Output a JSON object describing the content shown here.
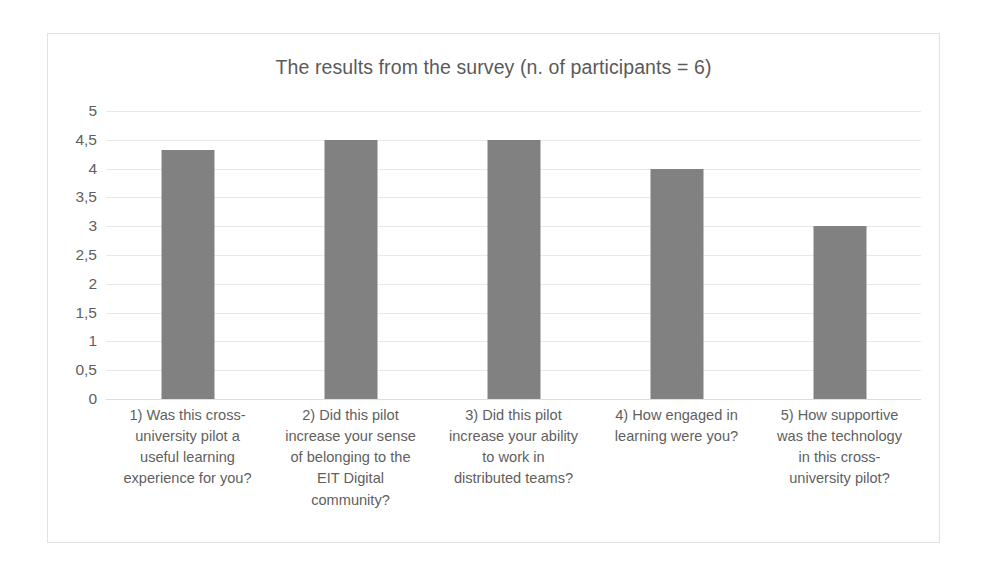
{
  "chart_data": {
    "type": "bar",
    "title": "The results from the survey (n. of participants = 6)",
    "xlabel": "",
    "ylabel": "",
    "ylim": [
      0,
      5
    ],
    "grid": true,
    "legend": "none",
    "orientation": "vertical",
    "bar_color": "#818181",
    "categories": [
      "1) Was this cross-university pilot a useful learning experience for you?",
      "2) Did this pilot increase your sense of belonging to the EIT Digital community?",
      "3) Did this pilot increase your ability to work in distributed teams?",
      "4) How engaged in learning were you?",
      "5) How supportive was the technology in this cross-university pilot?"
    ],
    "category_lines": [
      [
        "1) Was this cross-",
        "university pilot a",
        "useful learning",
        "experience for you?"
      ],
      [
        "2) Did this pilot",
        "increase your sense",
        "of belonging to the",
        "EIT Digital",
        "community?"
      ],
      [
        "3) Did this pilot",
        "increase your ability",
        "to work in",
        "distributed teams?"
      ],
      [
        "4) How engaged in",
        "learning were you?"
      ],
      [
        "5) How supportive",
        "was the technology",
        "in this cross-",
        "university pilot?"
      ]
    ],
    "values": [
      4.33,
      4.5,
      4.5,
      4,
      3
    ],
    "ytick_values": [
      5,
      4.5,
      4,
      3.5,
      3,
      2.5,
      2,
      1.5,
      1,
      0.5,
      0
    ],
    "ytick_labels": [
      "5",
      "4,5",
      "4",
      "3,5",
      "3",
      "2,5",
      "2",
      "1,5",
      "1",
      "0,5",
      "0"
    ]
  }
}
